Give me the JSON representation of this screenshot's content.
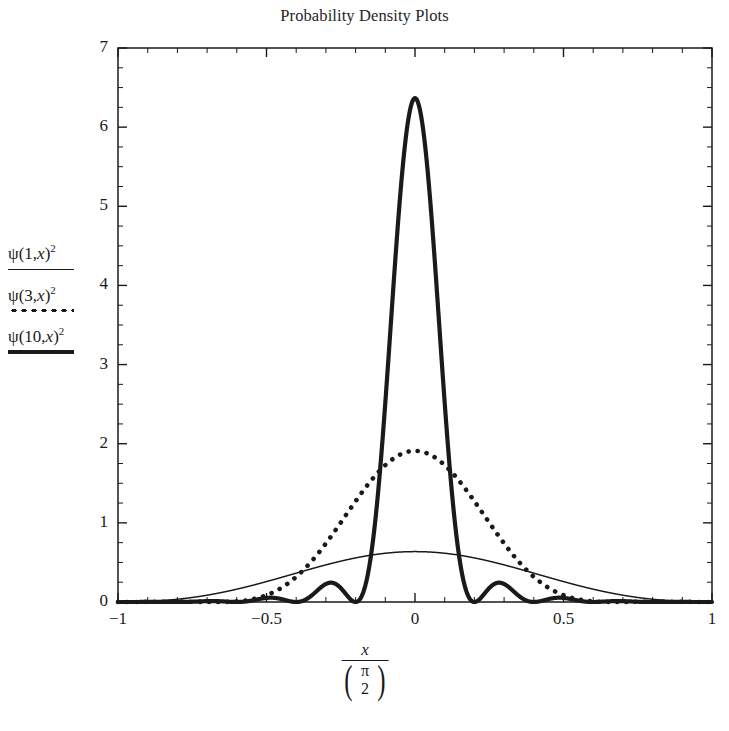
{
  "chart_data": {
    "type": "line",
    "title": "Probability Density Plots",
    "xlabel_numerator": "x",
    "xlabel_denominator_numerator": "π",
    "xlabel_denominator_denominator": "2",
    "ylabel": "",
    "xlim": [
      -1,
      1
    ],
    "ylim": [
      0,
      7
    ],
    "grid": false,
    "legend_position": "outside-left",
    "xticks": [
      -1,
      -0.5,
      0,
      0.5,
      1
    ],
    "xtick_labels": [
      "−1",
      "−0.5",
      "0",
      "0.5",
      "1"
    ],
    "yticks": [
      0,
      1,
      2,
      3,
      4,
      5,
      6,
      7
    ],
    "ytick_labels": [
      "0",
      "1",
      "2",
      "3",
      "4",
      "5",
      "6",
      "7"
    ],
    "series": [
      {
        "name": "ψ(1,x)²",
        "n": 1,
        "style": "solid-thin",
        "color": "#1a1a1a",
        "peak_value": 0.64,
        "peak_x": 0,
        "description": "Broad single-hump cosine-squared density, maximum 0.637 at x=0, falling to 0 at x=±1"
      },
      {
        "name": "ψ(3,x)²",
        "n": 3,
        "style": "dotted",
        "color": "#1a1a1a",
        "peak_value": 1.93,
        "peak_x": 0,
        "side_lobe_value": 0.43,
        "description": "Central lobe 1.93 at x=0 with two side lobes of height ~0.43 near x=±0.78"
      },
      {
        "name": "ψ(10,x)²",
        "n": 10,
        "style": "solid-thick",
        "color": "#1a1a1a",
        "peak_value": 6.37,
        "peak_x": 0,
        "side_lobe_values": [
          0.72,
          0.26,
          0.14,
          0.09
        ],
        "description": "Sharp central peak 6.37 at x=0 with decaying side lobes"
      }
    ]
  },
  "chart": {
    "title": "Probability Density Plots"
  },
  "legend": {
    "entries": [
      {
        "psi": "ψ",
        "arg": "(1,",
        "var": "x",
        "close": ")",
        "exp": "2",
        "style": "solid-thin"
      },
      {
        "psi": "ψ",
        "arg": "(3,",
        "var": "x",
        "close": ")",
        "exp": "2",
        "style": "dotted"
      },
      {
        "psi": "ψ",
        "arg": "(10,",
        "var": "x",
        "close": ")",
        "exp": "2",
        "style": "solid-thick"
      }
    ]
  },
  "axes": {
    "x_tick_labels": [
      "−1",
      "−0.5",
      "0",
      "0.5",
      "1"
    ],
    "y_tick_labels": [
      "0",
      "1",
      "2",
      "3",
      "4",
      "5",
      "6",
      "7"
    ],
    "x_label": {
      "numerator": "x",
      "denominator_top": "π",
      "denominator_bottom": "2",
      "paren_left": "(",
      "paren_right": ")"
    }
  },
  "colors": {
    "ink": "#1a1a1a",
    "background": "#ffffff"
  }
}
